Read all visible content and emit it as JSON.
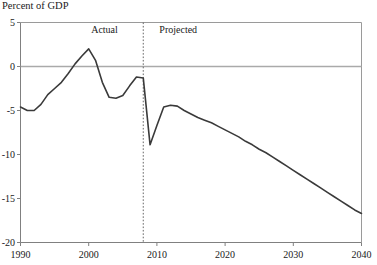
{
  "chart_data": {
    "type": "line",
    "title": "Percent of GDP",
    "xlabel": "",
    "ylabel": "Percent of GDP",
    "xlim": [
      1990,
      2040
    ],
    "ylim": [
      -20,
      5
    ],
    "yticks": [
      5,
      0,
      -5,
      -10,
      -15,
      -20
    ],
    "ytick_labels": [
      "5",
      "0",
      "-5",
      "-10",
      "-15",
      "-20"
    ],
    "xticks": [
      1990,
      2000,
      2010,
      2020,
      2030,
      2040
    ],
    "xtick_labels": [
      "1990",
      "2000",
      "2010",
      "2020",
      "2030",
      "2040"
    ],
    "grid": false,
    "zero_line": true,
    "legend": "none",
    "annotations": [
      {
        "text": "Actual",
        "x": 2003,
        "y": 4.2,
        "name": "actual-label"
      },
      {
        "text": "Projected",
        "x": 2013,
        "y": 4.2,
        "name": "projected-label"
      }
    ],
    "divider": {
      "x": 2008,
      "style": "dotted",
      "name": "actual-projected-divider"
    },
    "series": [
      {
        "name": "Budget balance",
        "color": "#3a3a3a",
        "x": [
          1990,
          1991,
          1992,
          1993,
          1994,
          1995,
          1996,
          1997,
          1998,
          1999,
          2000,
          2001,
          2002,
          2003,
          2004,
          2005,
          2006,
          2007,
          2008,
          2009,
          2010,
          2011,
          2012,
          2013,
          2014,
          2015,
          2016,
          2017,
          2018,
          2019,
          2020,
          2021,
          2022,
          2023,
          2024,
          2025,
          2026,
          2027,
          2028,
          2029,
          2030,
          2031,
          2032,
          2033,
          2034,
          2035,
          2036,
          2037,
          2038,
          2039,
          2040
        ],
        "values": [
          -4.6,
          -5.0,
          -5.0,
          -4.3,
          -3.2,
          -2.5,
          -1.8,
          -0.8,
          0.3,
          1.2,
          2.0,
          0.7,
          -1.8,
          -3.5,
          -3.6,
          -3.3,
          -2.2,
          -1.2,
          -1.3,
          -8.9,
          -6.7,
          -4.6,
          -4.4,
          -4.5,
          -5.0,
          -5.4,
          -5.8,
          -6.1,
          -6.4,
          -6.8,
          -7.2,
          -7.6,
          -8.0,
          -8.5,
          -8.9,
          -9.4,
          -9.8,
          -10.3,
          -10.8,
          -11.3,
          -11.8,
          -12.3,
          -12.8,
          -13.3,
          -13.8,
          -14.3,
          -14.8,
          -15.3,
          -15.8,
          -16.3,
          -16.7
        ]
      }
    ]
  }
}
